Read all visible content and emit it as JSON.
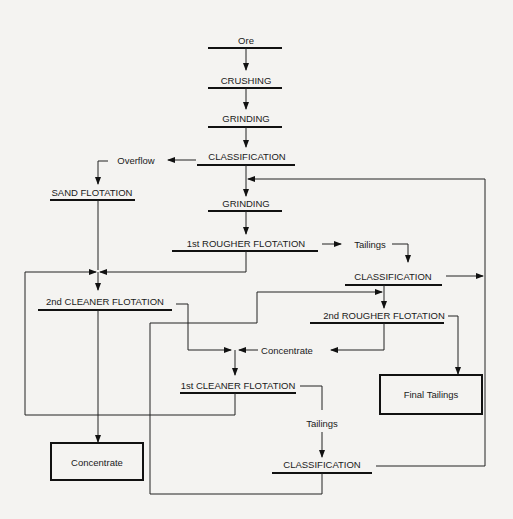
{
  "diagram": {
    "nodes": {
      "ore": "Ore",
      "crushing": "CRUSHING",
      "grinding1": "GRINDING",
      "classification1": "CLASSIFICATION",
      "overflow": "Overflow",
      "sand_flotation": "SAND FLOTATION",
      "grinding2": "GRINDING",
      "rougher1": "1st ROUGHER FLOTATION",
      "tailings1": "Tailings",
      "classification2": "CLASSIFICATION",
      "cleaner2": "2nd CLEANER FLOTATION",
      "rougher2": "2nd ROUGHER FLOTATION",
      "concentrate_mid": "Concentrate",
      "cleaner1": "1st CLEANER FLOTATION",
      "final_tailings": "Final Tailings",
      "tailings2": "Tailings",
      "concentrate_box": "Concentrate",
      "classification3": "CLASSIFICATION"
    }
  }
}
